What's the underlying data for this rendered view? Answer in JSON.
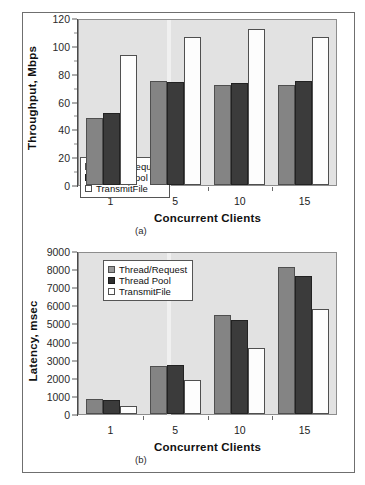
{
  "figure": {
    "series_colors": {
      "thread_request": "#848484",
      "thread_pool": "#3b3b3b",
      "transmitfile": "#fdfdfd"
    },
    "plot_background": "#e2e2e2",
    "legend_labels": [
      "Thread/Request",
      "Thread Pool",
      "TransmitFile"
    ]
  },
  "chart_data": [
    {
      "type": "bar",
      "id": "a",
      "title": "",
      "caption": "(a)",
      "xlabel": "Concurrent Clients",
      "ylabel": "Throughput, Mbps",
      "categories": [
        "1",
        "5",
        "10",
        "15"
      ],
      "ylim": [
        0,
        120
      ],
      "yticks": [
        0,
        20,
        40,
        60,
        80,
        100,
        120
      ],
      "ytick_labels": [
        "0",
        "20",
        "40",
        "60",
        "80",
        "100",
        "120"
      ],
      "grid": false,
      "legend_position": "inside-lower-left",
      "series": [
        {
          "name": "Thread/Request",
          "color": "#848484",
          "values": [
            48.5,
            74.5,
            72,
            72
          ]
        },
        {
          "name": "Thread Pool",
          "color": "#3b3b3b",
          "values": [
            52,
            74,
            73,
            74.5
          ]
        },
        {
          "name": "TransmitFile",
          "color": "#fdfdfd",
          "values": [
            93.5,
            106.5,
            112,
            106
          ]
        }
      ]
    },
    {
      "type": "bar",
      "id": "b",
      "title": "",
      "caption": "(b)",
      "xlabel": "Concurrent Clients",
      "ylabel": "Latency, msec",
      "categories": [
        "1",
        "5",
        "10",
        "15"
      ],
      "ylim": [
        0,
        9000
      ],
      "yticks": [
        0,
        1000,
        2000,
        3000,
        4000,
        5000,
        6000,
        7000,
        8000,
        9000
      ],
      "ytick_labels": [
        "0",
        "1000",
        "2000",
        "3000",
        "4000",
        "5000",
        "6000",
        "7000",
        "8000",
        "9000"
      ],
      "grid": false,
      "legend_position": "inside-upper-left",
      "series": [
        {
          "name": "Thread/Request",
          "color": "#848484",
          "values": [
            820,
            2650,
            5450,
            8100
          ]
        },
        {
          "name": "Thread Pool",
          "color": "#3b3b3b",
          "values": [
            790,
            2680,
            5200,
            7600
          ]
        },
        {
          "name": "TransmitFile",
          "color": "#fdfdfd",
          "values": [
            430,
            1900,
            3620,
            5800
          ]
        }
      ]
    }
  ]
}
